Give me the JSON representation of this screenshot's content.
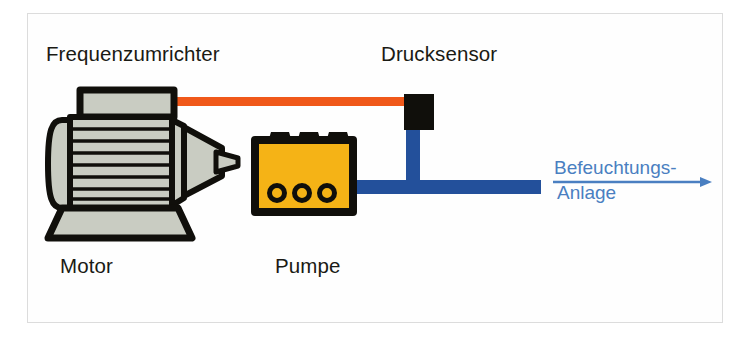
{
  "diagram": {
    "type": "schematic",
    "labels": {
      "frequency_converter": "Frequenzumrichter",
      "pressure_sensor": "Drucksensor",
      "motor": "Motor",
      "pump": "Pumpe",
      "destination_line1": "Befeuchtungs-",
      "destination_line2": "Anlage"
    },
    "colors": {
      "pump_body": "#F5B316",
      "control_cable": "#F0581A",
      "water_pipe": "#23509B",
      "metal_grey": "#C9CCC2",
      "outline_black": "#100F0B",
      "destination_text": "#4A7FC1",
      "page_background": "#FFFFFF",
      "frame_border": "#DCDCDC"
    },
    "components": [
      {
        "name": "electric-motor",
        "shape": "ribbed cylindrical body with terminal box on top and base plate",
        "fill": "#C9CCC2"
      },
      {
        "name": "motor-terminal-box",
        "shape": "rectangle on top of motor",
        "fill": "#C9CCC2"
      },
      {
        "name": "motor-coupling-cone",
        "shape": "tapered cone between motor and pump",
        "fill": "#C9CCC2"
      },
      {
        "name": "pump",
        "shape": "rectangle with three top bumps and three bottom ports",
        "fill": "#F5B316"
      },
      {
        "name": "pressure-sensor",
        "shape": "solid black rectangle",
        "fill": "#100F0B"
      },
      {
        "name": "control-cable",
        "shape": "horizontal orange line from terminal box to pressure sensor",
        "fill": "#F0581A"
      },
      {
        "name": "discharge-pipe",
        "shape": "blue T-shaped pipe from pump outlet to the right edge, branch rises to pressure sensor",
        "fill": "#23509B"
      },
      {
        "name": "flow-arrow",
        "shape": "horizontal arrow pointing right under the destination label",
        "fill": "#4A7FC1"
      }
    ]
  }
}
